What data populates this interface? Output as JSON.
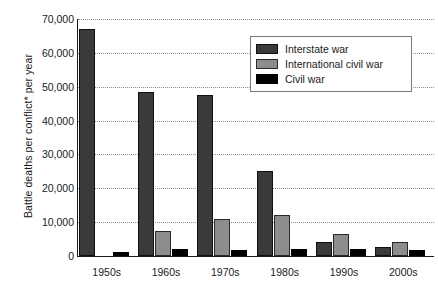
{
  "chart_data": {
    "type": "bar",
    "title": "",
    "xlabel": "",
    "ylabel": "Battle deaths per conflict* per year",
    "categories": [
      "1950s",
      "1960s",
      "1970s",
      "1980s",
      "1990s",
      "2000s"
    ],
    "ylim": [
      0,
      70000
    ],
    "yticks": [
      0,
      10000,
      20000,
      30000,
      40000,
      50000,
      60000,
      70000
    ],
    "ytick_labels": [
      "0",
      "10,000",
      "20,000",
      "30,000",
      "40,000",
      "50,000",
      "60,000",
      "70,000"
    ],
    "grid": true,
    "grid_style": "dotted-horizontal",
    "legend_position": "top-right",
    "series": [
      {
        "name": "Interstate war",
        "color": "#3a3a3a",
        "values": [
          67000,
          48500,
          47700,
          25200,
          4000,
          2700
        ]
      },
      {
        "name": "International civil war",
        "color": "#8d8d8d",
        "values": [
          0,
          7500,
          11000,
          12000,
          6500,
          4200
        ]
      },
      {
        "name": "Civil war",
        "color": "#000000",
        "values": [
          1300,
          2200,
          1800,
          2200,
          2100,
          1800
        ]
      }
    ]
  },
  "legend": {
    "items": [
      {
        "label": "Interstate war",
        "swatch": "interstate-swatch"
      },
      {
        "label": "International civil war",
        "swatch": "international-civil-swatch"
      },
      {
        "label": "Civil war",
        "swatch": "civil-swatch"
      }
    ]
  },
  "axes": {
    "y_title": "Battle deaths per conflict* per year"
  }
}
